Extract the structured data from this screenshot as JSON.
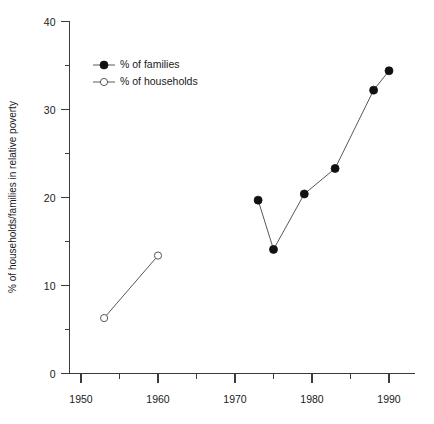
{
  "chart_data": {
    "type": "line",
    "title": "",
    "xlabel": "",
    "ylabel": "% of households/families in relative poverty",
    "xlim": [
      1948,
      1995
    ],
    "ylim": [
      0,
      40
    ],
    "grid": false,
    "legend_position": "upper-left-inside",
    "x_ticks_major": [
      1950,
      1960,
      1970,
      1980,
      1990
    ],
    "x_ticks_minor": [
      1955,
      1965,
      1975,
      1985
    ],
    "y_ticks_major": [
      0,
      10,
      20,
      30,
      40
    ],
    "y_ticks_minor": [
      5,
      15,
      25,
      35
    ],
    "series": [
      {
        "name": "% of families",
        "marker": "filled-circle",
        "x": [
          1973,
          1975,
          1979,
          1983,
          1988,
          1990
        ],
        "values": [
          19.7,
          14.1,
          20.4,
          23.3,
          32.2,
          34.4
        ]
      },
      {
        "name": "% of households",
        "marker": "open-circle",
        "x": [
          1953,
          1960
        ],
        "values": [
          6.3,
          13.4
        ]
      }
    ]
  },
  "axes": {
    "y_title": "% of households/families in relative poverty",
    "y_tick_labels": [
      "0",
      "10",
      "20",
      "30",
      "40"
    ],
    "x_tick_labels": [
      "1950",
      "1960",
      "1970",
      "1980",
      "1990"
    ]
  },
  "legend": {
    "items": [
      {
        "label": "% of families"
      },
      {
        "label": "% of households"
      }
    ]
  },
  "colors": {
    "line": "#55595c",
    "marker_fill": "#111111",
    "marker_open_fill": "#ffffff",
    "axis": "#3b3b3b",
    "text": "#1a1a1a",
    "background": "#ffffff"
  }
}
